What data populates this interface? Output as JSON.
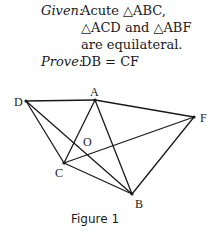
{
  "problem": {
    "given_label": "Given:",
    "given_lines": [
      "Acute △ABC,",
      "△ACD and △ABF",
      "are equilateral."
    ],
    "prove_label": "Prove:",
    "prove_text": "DB = CF"
  },
  "figure": {
    "caption": "Figure 1",
    "points": {
      "A": {
        "x": 95,
        "y": 100
      },
      "B": {
        "x": 132,
        "y": 194
      },
      "C": {
        "x": 64,
        "y": 163
      },
      "D": {
        "x": 26,
        "y": 101
      },
      "F": {
        "x": 194,
        "y": 117
      },
      "O": {
        "x": 86,
        "y": 155
      }
    },
    "labels": {
      "A": "A",
      "B": "B",
      "C": "C",
      "D": "D",
      "F": "F",
      "O": "O"
    },
    "segments": [
      [
        "D",
        "A"
      ],
      [
        "A",
        "F"
      ],
      [
        "D",
        "C"
      ],
      [
        "D",
        "B"
      ],
      [
        "A",
        "C"
      ],
      [
        "A",
        "B"
      ],
      [
        "C",
        "B"
      ],
      [
        "C",
        "F"
      ],
      [
        "F",
        "B"
      ]
    ],
    "stroke_color": "#1a1a1a"
  }
}
